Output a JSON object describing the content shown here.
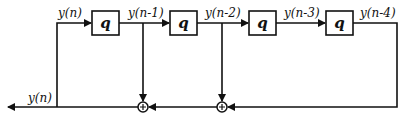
{
  "diagram": {
    "type": "block-diagram",
    "delay_block_label": "q",
    "blocks": [
      {
        "label": "q",
        "input": "y(n)",
        "output": "y(n-1)"
      },
      {
        "label": "q",
        "input": "y(n-1)",
        "output": "y(n-2)"
      },
      {
        "label": "q",
        "input": "y(n-2)",
        "output": "y(n-3)"
      },
      {
        "label": "q",
        "input": "y(n-3)",
        "output": "y(n-4)"
      }
    ],
    "signals": {
      "s0": "y(n)",
      "s1": "y(n-1)",
      "s2": "y(n-2)",
      "s3": "y(n-3)",
      "s4": "y(n-4)",
      "output": "y(n)"
    },
    "summing_junctions": [
      {
        "symbol": "+",
        "inputs": [
          "y(n-1)",
          "sum2"
        ]
      },
      {
        "symbol": "+",
        "inputs": [
          "y(n-2)",
          "y(n-4)"
        ]
      }
    ]
  }
}
